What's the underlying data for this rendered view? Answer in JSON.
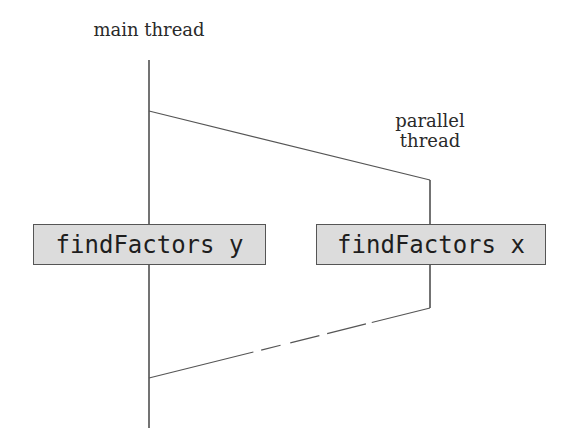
{
  "labels": {
    "main_thread": "main thread",
    "parallel_thread_line1": "parallel",
    "parallel_thread_line2": "thread"
  },
  "boxes": {
    "left": "findFactors y",
    "right": "findFactors x"
  },
  "colors": {
    "line": "#444444",
    "box_fill": "#dcdcdc",
    "box_border": "#555555",
    "text": "#1e1e1e"
  }
}
